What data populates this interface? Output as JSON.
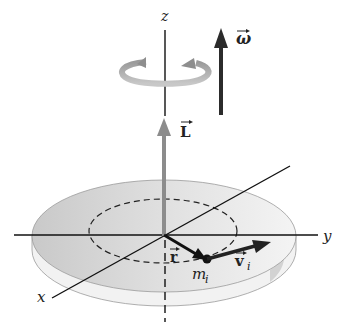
{
  "diagram": {
    "type": "rigid-body-rotation",
    "axes": {
      "z": "z",
      "y": "y",
      "x": "x"
    },
    "vectors": {
      "omega": {
        "label": "ω",
        "color": "#2b2b2b"
      },
      "L": {
        "label": "L",
        "color": "#8c8c8c"
      },
      "r": {
        "label": "r",
        "color": "#111111"
      },
      "v_i": {
        "label": "v",
        "subscript": "i",
        "color": "#222222"
      }
    },
    "particle": {
      "label": "m",
      "subscript": "i"
    },
    "colors": {
      "disc_top": "#d4d4d4",
      "disc_edge": "#ebebeb",
      "rotation_arrow": "#b0b0b0",
      "axis": "#111111"
    }
  }
}
